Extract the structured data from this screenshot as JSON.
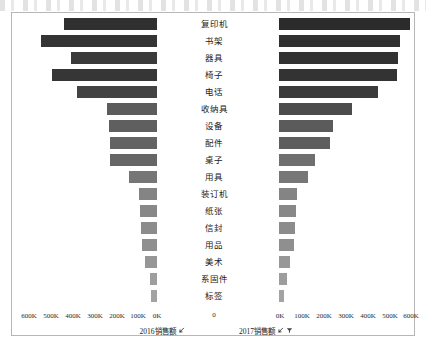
{
  "chart_data": {
    "type": "bar",
    "subtype": "diverging-tornado-bar",
    "title": "",
    "categories": [
      "复印机",
      "书架",
      "器具",
      "椅子",
      "电话",
      "收纳具",
      "设备",
      "配件",
      "桌子",
      "用具",
      "装订机",
      "纸张",
      "信封",
      "用品",
      "美术",
      "系固件",
      "标签"
    ],
    "series": [
      {
        "name": "2016销售额",
        "direction": "left",
        "values": [
          423000,
          527000,
          391000,
          477000,
          364000,
          227000,
          218000,
          215000,
          212000,
          127000,
          82000,
          77000,
          73000,
          68000,
          55000,
          32000,
          27000
        ]
      },
      {
        "name": "2017销售额",
        "direction": "right",
        "values": [
          595000,
          550000,
          541000,
          536000,
          450000,
          332000,
          245000,
          232000,
          164000,
          132000,
          80000,
          77000,
          72000,
          68000,
          50000,
          36000,
          23000
        ]
      }
    ],
    "xlabel_left": "2016销售额",
    "xlabel_right": "2017销售额",
    "ylabel": "",
    "left_axis": {
      "ticks": [
        "600K",
        "500K",
        "400K",
        "300K",
        "200K",
        "100K",
        "0K"
      ],
      "tick_values": [
        600000,
        500000,
        400000,
        300000,
        200000,
        100000,
        0
      ],
      "reversed": true
    },
    "right_axis": {
      "ticks": [
        "0K",
        "100K",
        "200K",
        "300K",
        "400K",
        "500K",
        "600K"
      ],
      "tick_values": [
        0,
        100000,
        200000,
        300000,
        400000,
        500000,
        600000
      ],
      "reversed": false
    },
    "center_axis_label": "0",
    "grid": false,
    "legend": "none",
    "bar_colors": {
      "darkest": "#2f2f2f",
      "dark": "#3d3d3d",
      "medium_dark": "#4d4d4d",
      "medium": "#666666",
      "light": "#8a8a8a",
      "lightest": "#a6a6a6"
    }
  },
  "axis_left": {
    "title": "2016销售额",
    "sort_icon": "sort-ascending-icon",
    "ticks": [
      {
        "label": "600K",
        "x": 28
      },
      {
        "label": "500K",
        "x": 50
      },
      {
        "label": "400K",
        "x": 72
      },
      {
        "label": "300K",
        "x": 94
      },
      {
        "label": "200K",
        "x": 116
      },
      {
        "label": "100K",
        "x": 137
      },
      {
        "label": "0K",
        "x": 156
      }
    ]
  },
  "axis_right": {
    "title": "2017销售额",
    "sort_icon": "sort-ascending-icon",
    "filter_icon": "filter-icon",
    "ticks": [
      {
        "label": "0K",
        "x": 279
      },
      {
        "label": "100K",
        "x": 301
      },
      {
        "label": "200K",
        "x": 323
      },
      {
        "label": "300K",
        "x": 345
      },
      {
        "label": "400K",
        "x": 367
      },
      {
        "label": "500K",
        "x": 389
      },
      {
        "label": "600K",
        "x": 410
      }
    ]
  },
  "center_axis": {
    "zero_label": "0"
  },
  "rows": [
    {
      "label": "复印机",
      "left_w": 93,
      "left_color": "#303030",
      "right_w": 131,
      "right_color": "#2b2b2b"
    },
    {
      "label": "书架",
      "left_w": 116,
      "left_color": "#343434",
      "right_w": 121,
      "right_color": "#303030"
    },
    {
      "label": "器具",
      "left_w": 86,
      "left_color": "#3a3a3a",
      "right_w": 119,
      "right_color": "#323232"
    },
    {
      "label": "椅子",
      "left_w": 105,
      "left_color": "#363636",
      "right_w": 118,
      "right_color": "#333333"
    },
    {
      "label": "电话",
      "left_w": 80,
      "left_color": "#434343",
      "right_w": 99,
      "right_color": "#3b3b3b"
    },
    {
      "label": "收纳具",
      "left_w": 50,
      "left_color": "#5c5c5c",
      "right_w": 73,
      "right_color": "#4c4c4c"
    },
    {
      "label": "设备",
      "left_w": 48,
      "left_color": "#5f5f5f",
      "right_w": 54,
      "right_color": "#5b5b5b"
    },
    {
      "label": "配件",
      "left_w": 47,
      "left_color": "#636363",
      "right_w": 51,
      "right_color": "#5e5e5e"
    },
    {
      "label": "桌子",
      "left_w": 47,
      "left_color": "#666666",
      "right_w": 36,
      "right_color": "#6f6f6f"
    },
    {
      "label": "用具",
      "left_w": 28,
      "left_color": "#767676",
      "right_w": 29,
      "right_color": "#777777"
    },
    {
      "label": "装订机",
      "left_w": 18,
      "left_color": "#848484",
      "right_w": 18,
      "right_color": "#848484"
    },
    {
      "label": "纸张",
      "left_w": 17,
      "left_color": "#888888",
      "right_w": 17,
      "right_color": "#888888"
    },
    {
      "label": "信封",
      "left_w": 16,
      "left_color": "#8c8c8c",
      "right_w": 16,
      "right_color": "#8c8c8c"
    },
    {
      "label": "用品",
      "left_w": 15,
      "left_color": "#8f8f8f",
      "right_w": 15,
      "right_color": "#8f8f8f"
    },
    {
      "label": "美术",
      "left_w": 12,
      "left_color": "#969696",
      "right_w": 11,
      "right_color": "#979797"
    },
    {
      "label": "系固件",
      "left_w": 7,
      "left_color": "#9e9e9e",
      "right_w": 8,
      "right_color": "#9d9d9d"
    },
    {
      "label": "标签",
      "left_w": 6,
      "left_color": "#a2a2a2",
      "right_w": 5,
      "right_color": "#a3a3a3"
    }
  ]
}
